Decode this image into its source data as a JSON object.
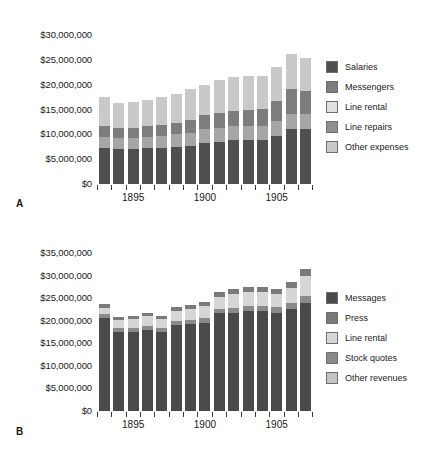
{
  "figure": {
    "background": "#ffffff"
  },
  "chart_data": [
    {
      "id": "panel-a",
      "panel_letter": "A",
      "type": "bar",
      "stacked": true,
      "title": "",
      "xlabel": "",
      "ylabel": "",
      "grid": false,
      "legend_position": "right",
      "ylim": [
        0,
        30000000
      ],
      "ytick_values": [
        0,
        5000000,
        10000000,
        15000000,
        20000000,
        25000000,
        30000000
      ],
      "ytick_labels": [
        "$0",
        "$5,000,000",
        "$10,000,000",
        "$15,000,000",
        "$20,000,000",
        "$25,000,000",
        "$30,000,000"
      ],
      "x": [
        1893,
        1894,
        1895,
        1896,
        1897,
        1898,
        1899,
        1900,
        1901,
        1902,
        1903,
        1904,
        1905,
        1906,
        1907
      ],
      "xtick_labeled": [
        1895,
        1900,
        1905
      ],
      "xtick_labels": [
        "1895",
        "1900",
        "1905"
      ],
      "categories": [
        "1893",
        "1894",
        "1895",
        "1896",
        "1897",
        "1898",
        "1899",
        "1900",
        "1901",
        "1902",
        "1903",
        "1904",
        "1905",
        "1906",
        "1907"
      ],
      "series": [
        {
          "name": "Salaries",
          "color": "#4f4f4f",
          "values": [
            7200000,
            7100000,
            7100000,
            7200000,
            7300000,
            7500000,
            7700000,
            8300000,
            8500000,
            8800000,
            8900000,
            8900000,
            9700000,
            11100000,
            11000000
          ]
        },
        {
          "name": "Line repairs",
          "color": "#a6a6a6",
          "values": [
            2300000,
            2200000,
            2200000,
            2300000,
            2400000,
            2500000,
            2600000,
            2700000,
            2800000,
            2800000,
            2800000,
            2800000,
            2900000,
            3000000,
            3000000
          ]
        },
        {
          "name": "Messengers",
          "color": "#7d7d7d",
          "values": [
            2100000,
            1900000,
            2000000,
            2100000,
            2200000,
            2300000,
            2600000,
            2800000,
            3000000,
            3100000,
            3200000,
            3500000,
            4100000,
            5000000,
            4800000
          ]
        },
        {
          "name": "Other expenses",
          "color": "#c9c9c9",
          "values": [
            5900000,
            5100000,
            5200000,
            5400000,
            5600000,
            5800000,
            6200000,
            6200000,
            6700000,
            6900000,
            6800000,
            6600000,
            6900000,
            7000000,
            6600000
          ]
        }
      ],
      "stack_order": [
        "Salaries",
        "Line repairs",
        "Messengers",
        "Other expenses"
      ],
      "totals": [
        17500000,
        16300000,
        16500000,
        17000000,
        17500000,
        18100000,
        19100000,
        20000000,
        21000000,
        21600000,
        21700000,
        21800000,
        23600000,
        26100000,
        25400000
      ],
      "legend": [
        {
          "label": "Salaries",
          "color": "#4f4f4f"
        },
        {
          "label": "Messengers",
          "color": "#7d7d7d"
        },
        {
          "label": "Line rental",
          "color": "#e0e0e0"
        },
        {
          "label": "Line repairs",
          "color": "#8f8f8f"
        },
        {
          "label": "Other expenses",
          "color": "#c9c9c9"
        }
      ]
    },
    {
      "id": "panel-b",
      "panel_letter": "B",
      "type": "bar",
      "stacked": true,
      "title": "",
      "xlabel": "",
      "ylabel": "",
      "grid": false,
      "legend_position": "right",
      "ylim": [
        0,
        35000000
      ],
      "ytick_values": [
        0,
        5000000,
        10000000,
        15000000,
        20000000,
        25000000,
        30000000,
        35000000
      ],
      "ytick_labels": [
        "$0",
        "$5,000,000",
        "$10,000,000",
        "$15,000,000",
        "$20,000,000",
        "$25,000,000",
        "$30,000,000",
        "$35,000,000"
      ],
      "x": [
        1893,
        1894,
        1895,
        1896,
        1897,
        1898,
        1899,
        1900,
        1901,
        1902,
        1903,
        1904,
        1905,
        1906,
        1907
      ],
      "xtick_labeled": [
        1895,
        1900,
        1905
      ],
      "xtick_labels": [
        "1895",
        "1900",
        "1905"
      ],
      "categories": [
        "1893",
        "1894",
        "1895",
        "1896",
        "1897",
        "1898",
        "1899",
        "1900",
        "1901",
        "1902",
        "1903",
        "1904",
        "1905",
        "1906",
        "1907"
      ],
      "series": [
        {
          "name": "Messages",
          "color": "#4a4a4a",
          "values": [
            20500000,
            17400000,
            17500000,
            18000000,
            17400000,
            19000000,
            19300000,
            19500000,
            21700000,
            21800000,
            22100000,
            22200000,
            21800000,
            22600000,
            24000000,
            21000000
          ]
        },
        {
          "name": "Stock quotes",
          "color": "#8a8a8a",
          "values": [
            900000,
            900000,
            900000,
            900000,
            900000,
            900000,
            900000,
            1000000,
            1000000,
            1100000,
            1100000,
            1100000,
            1200000,
            1400000,
            1500000,
            1400000
          ]
        },
        {
          "name": "Line rental",
          "color": "#d6d6d6",
          "values": [
            1500000,
            1900000,
            2000000,
            2100000,
            2100000,
            2300000,
            2500000,
            2700000,
            2600000,
            3000000,
            3100000,
            3000000,
            3000000,
            3300000,
            4500000,
            3200000
          ]
        },
        {
          "name": "Press",
          "color": "#7a7a7a",
          "values": [
            900000,
            700000,
            700000,
            700000,
            700000,
            800000,
            800000,
            900000,
            1000000,
            1100000,
            1100000,
            1100000,
            1100000,
            1200000,
            1400000,
            1200000
          ]
        }
      ],
      "stack_order": [
        "Messages",
        "Stock quotes",
        "Line rental",
        "Press"
      ],
      "totals": [
        23800000,
        20900000,
        21100000,
        21700000,
        21100000,
        23000000,
        23500000,
        24100000,
        26300000,
        27000000,
        27400000,
        27400000,
        27100000,
        28500000,
        31400000,
        26800000
      ],
      "legend": [
        {
          "label": "Messages",
          "color": "#4a4a4a"
        },
        {
          "label": "Press",
          "color": "#7a7a7a"
        },
        {
          "label": "Line rental",
          "color": "#d6d6d6"
        },
        {
          "label": "Stock quotes",
          "color": "#8a8a8a"
        },
        {
          "label": "Other revenues",
          "color": "#c4c4c4"
        }
      ]
    }
  ]
}
